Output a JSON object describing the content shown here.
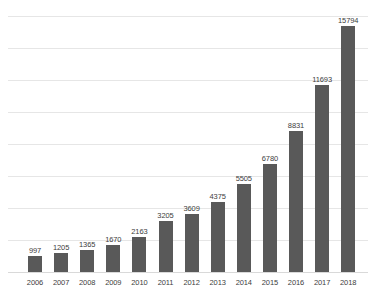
{
  "chart_data": {
    "type": "bar",
    "title": "",
    "subtitle": "",
    "xlabel": "",
    "ylabel": "",
    "categories": [
      "2006",
      "2007",
      "2008",
      "2009",
      "2010",
      "2011",
      "2012",
      "2013",
      "2014",
      "2015",
      "2016",
      "2017",
      "2018"
    ],
    "values": [
      997,
      1205,
      1365,
      1670,
      2163,
      3205,
      3609,
      4375,
      5505,
      6780,
      8831,
      11693,
      15794
    ],
    "value_labels": [
      "997",
      "1205",
      "1365",
      "1670",
      "2163",
      "3205",
      "3609",
      "4375",
      "5505",
      "6780",
      "8831",
      "11693",
      "15794"
    ],
    "ylim": [
      0,
      16000
    ],
    "y_tick_values": [
      2000,
      4000,
      6000,
      8000,
      10000,
      12000,
      14000,
      16000
    ],
    "y_tick_labels_visible": false,
    "grid": true,
    "grid_orientation": "horizontal",
    "legend": false,
    "legend_position": "none",
    "series": [
      {
        "name": "Series 1",
        "values": [
          997,
          1205,
          1365,
          1670,
          2163,
          3205,
          3609,
          4375,
          5505,
          6780,
          8831,
          11693,
          15794
        ]
      }
    ],
    "colors": {
      "bar": "#595959",
      "gridline": "#e6e6e6",
      "baseline": "#d9d9d9",
      "label_text": "#404040",
      "background": "#ffffff"
    }
  }
}
